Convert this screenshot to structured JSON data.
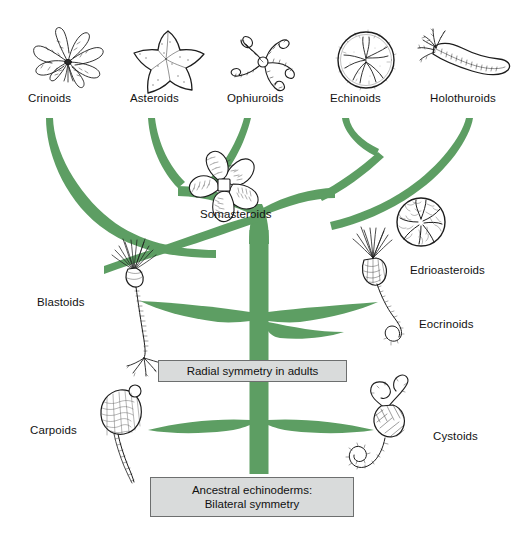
{
  "diagram": {
    "type": "phylogenetic-tree",
    "branch_color": "#5d9e63",
    "box_fill": "#d9dbdb",
    "box_border": "#6d6f6f",
    "background": "#ffffff"
  },
  "taxa": {
    "crown_top": [
      {
        "key": "crinoids",
        "label": "Crinoids",
        "icon": "crinoid-illustration"
      },
      {
        "key": "asteroids",
        "label": "Asteroids",
        "icon": "starfish-illustration"
      },
      {
        "key": "ophiuroids",
        "label": "Ophiuroids",
        "icon": "brittle-star-illustration"
      },
      {
        "key": "echinoids",
        "label": "Echinoids",
        "icon": "sea-urchin-illustration"
      },
      {
        "key": "holothuroids",
        "label": "Holothuroids",
        "icon": "sea-cucumber-illustration"
      }
    ],
    "extinct": [
      {
        "key": "somasteroids",
        "label": "Somasteroids",
        "icon": "somasteroid-illustration"
      },
      {
        "key": "edrioasteroids",
        "label": "Edrioasteroids",
        "icon": "edrioasteroid-illustration"
      },
      {
        "key": "eocrinoids",
        "label": "Eocrinoids",
        "icon": "eocrinoid-illustration"
      },
      {
        "key": "blastoids",
        "label": "Blastoids",
        "icon": "blastoid-illustration"
      },
      {
        "key": "carpoids",
        "label": "Carpoids",
        "icon": "carpoid-illustration"
      },
      {
        "key": "cystoids",
        "label": "Cystoids",
        "icon": "cystoid-illustration"
      }
    ]
  },
  "annotations": {
    "radial": "Radial symmetry in adults",
    "ancestral_line1": "Ancestral echinoderms:",
    "ancestral_line2": "Bilateral symmetry"
  }
}
